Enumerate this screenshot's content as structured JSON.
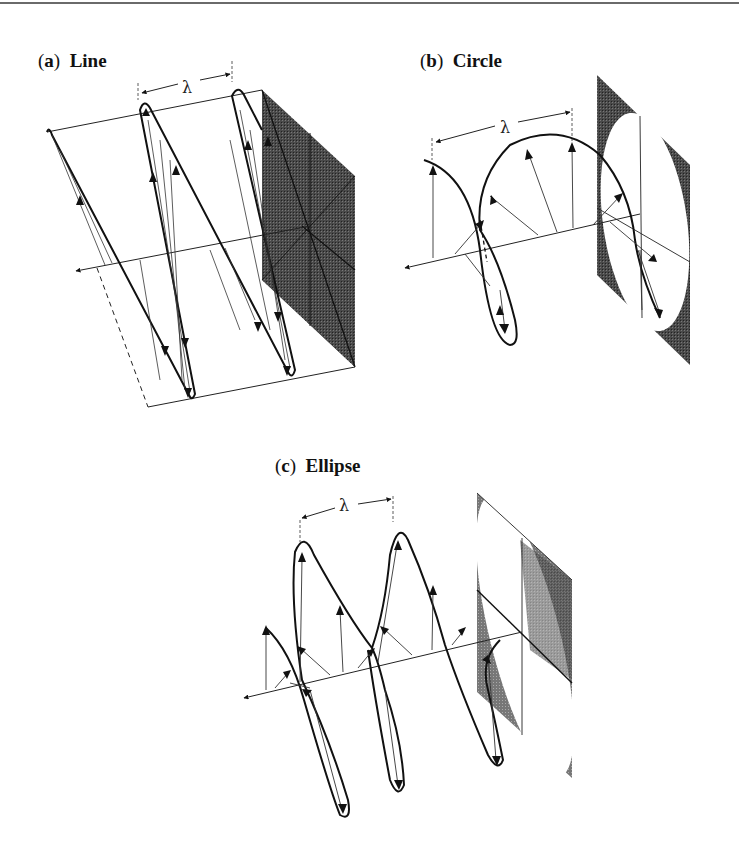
{
  "figure": {
    "panels": [
      {
        "id": "a",
        "letter": "a",
        "title": "Line",
        "wavelength_symbol": "λ"
      },
      {
        "id": "b",
        "letter": "b",
        "title": "Circle",
        "wavelength_symbol": "λ"
      },
      {
        "id": "c",
        "letter": "c",
        "title": "Ellipse",
        "wavelength_symbol": "λ"
      }
    ]
  },
  "colors": {
    "ink": "#111111",
    "thin_line": "#333333",
    "plane_shade": "#3a3a3a",
    "plane_light": "#8a8a8a"
  }
}
